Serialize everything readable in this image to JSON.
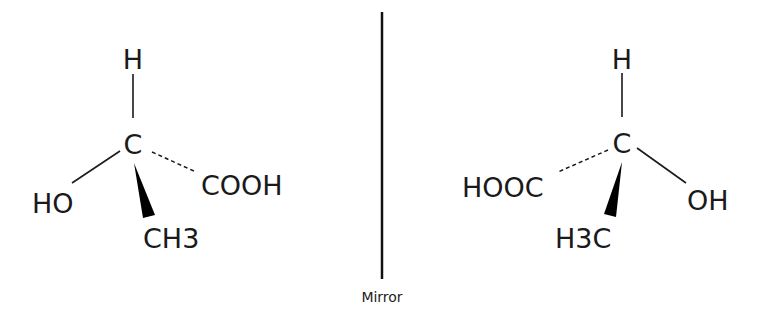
{
  "diagram": {
    "mirror": {
      "label": "Mirror"
    },
    "left_molecule": {
      "center": "C",
      "top": "H",
      "left": "HO",
      "right": "COOH",
      "bottom": {
        "main": "CH",
        "subscript": "3"
      },
      "bonds": {
        "top": "plain",
        "left": "plain",
        "right": "dashed",
        "bottom": "wedge"
      }
    },
    "right_molecule": {
      "center": "C",
      "top": "H",
      "left": "HOOC",
      "right": "OH",
      "bottom": {
        "main_pre": "H",
        "subscript": "3",
        "main_post": "C"
      },
      "bonds": {
        "top": "plain",
        "left": "dashed",
        "right": "plain",
        "bottom": "wedge"
      }
    },
    "colors": {
      "ink": "#1a1a1a",
      "background": "#ffffff"
    }
  }
}
